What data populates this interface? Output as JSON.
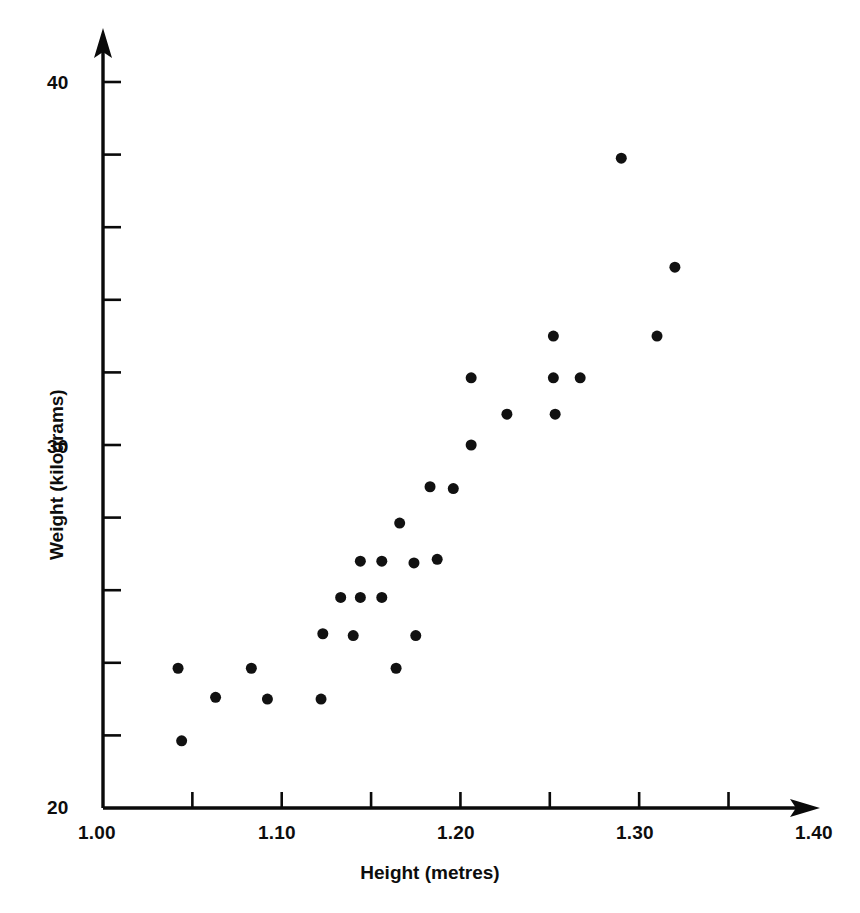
{
  "chart_data": {
    "type": "scatter",
    "title": "",
    "xlabel": "Height (metres)",
    "ylabel": "Weight (kilograms)",
    "xlim": [
      1.0,
      1.4
    ],
    "ylim": [
      20,
      40
    ],
    "grid": false,
    "legend": null,
    "marker": {
      "shape": "circle",
      "color": "#111111",
      "size_px": 11
    },
    "x_ticks_major": [
      "1.00",
      "1.10",
      "1.20",
      "1.30",
      "1.40"
    ],
    "x_tick_values_major": [
      1.0,
      1.1,
      1.2,
      1.3,
      1.4
    ],
    "x_tick_values_minor": [
      1.05,
      1.15,
      1.25,
      1.35
    ],
    "x_tick_step": 0.05,
    "y_ticks_major": [
      "20",
      "30",
      "40"
    ],
    "y_tick_values_major": [
      20,
      30,
      40
    ],
    "y_tick_values_minor": [
      22,
      24,
      26,
      28,
      32,
      34,
      36,
      38
    ],
    "y_tick_step": 2,
    "n_points": 29,
    "points": [
      {
        "x": 1.044,
        "y": 21.85
      },
      {
        "x": 1.042,
        "y": 23.85
      },
      {
        "x": 1.063,
        "y": 23.05
      },
      {
        "x": 1.092,
        "y": 23.0
      },
      {
        "x": 1.083,
        "y": 23.85
      },
      {
        "x": 1.122,
        "y": 23.0
      },
      {
        "x": 1.123,
        "y": 24.8
      },
      {
        "x": 1.133,
        "y": 25.8
      },
      {
        "x": 1.144,
        "y": 25.8
      },
      {
        "x": 1.14,
        "y": 24.75
      },
      {
        "x": 1.156,
        "y": 25.8
      },
      {
        "x": 1.144,
        "y": 26.8
      },
      {
        "x": 1.156,
        "y": 26.8
      },
      {
        "x": 1.164,
        "y": 23.85
      },
      {
        "x": 1.175,
        "y": 24.75
      },
      {
        "x": 1.166,
        "y": 27.85
      },
      {
        "x": 1.174,
        "y": 26.75
      },
      {
        "x": 1.187,
        "y": 26.85
      },
      {
        "x": 1.196,
        "y": 28.8
      },
      {
        "x": 1.183,
        "y": 28.85
      },
      {
        "x": 1.206,
        "y": 30.0
      },
      {
        "x": 1.206,
        "y": 31.85
      },
      {
        "x": 1.226,
        "y": 30.85
      },
      {
        "x": 1.252,
        "y": 33.0
      },
      {
        "x": 1.252,
        "y": 31.85
      },
      {
        "x": 1.253,
        "y": 30.85
      },
      {
        "x": 1.267,
        "y": 31.85
      },
      {
        "x": 1.29,
        "y": 37.9
      },
      {
        "x": 1.31,
        "y": 33.0
      },
      {
        "x": 1.32,
        "y": 34.9
      }
    ]
  },
  "axes": {
    "y_label": "Weight (kilograms)",
    "x_label": "Height (metres)",
    "y_top_label": "40",
    "y_mid_label": "30",
    "y_bottom_label": "20",
    "x_labels": {
      "t100": "1.00",
      "t110": "1.10",
      "t120": "1.20",
      "t130": "1.30",
      "t140": "1.40"
    }
  }
}
